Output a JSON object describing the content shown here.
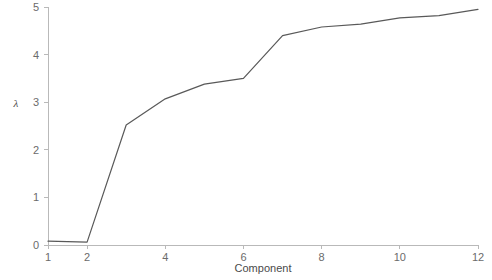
{
  "chart_data": {
    "type": "line",
    "title": "",
    "subtitle": "",
    "xlabel": "Component",
    "ylabel": "λ",
    "x": [
      1,
      2,
      3,
      4,
      5,
      6,
      7,
      8,
      9,
      10,
      11,
      12
    ],
    "values": [
      0.08,
      0.06,
      2.52,
      3.07,
      3.38,
      3.5,
      4.4,
      4.58,
      4.64,
      4.77,
      4.82,
      4.95
    ],
    "series": [
      {
        "name": "eigenvalue",
        "values": [
          0.08,
          0.06,
          2.52,
          3.07,
          3.38,
          3.5,
          4.4,
          4.58,
          4.64,
          4.77,
          4.82,
          4.95
        ]
      }
    ],
    "xlim": [
      1,
      12
    ],
    "ylim": [
      0,
      5
    ],
    "xticks": [
      1,
      2,
      4,
      6,
      8,
      10,
      12
    ],
    "xtick_labels": [
      "1",
      "2",
      "4",
      "6",
      "8",
      "10",
      "12"
    ],
    "yticks": [
      0,
      1,
      2,
      3,
      4,
      5
    ],
    "ytick_labels": [
      "0",
      "1",
      "2",
      "3",
      "4",
      "5"
    ],
    "grid": false,
    "legend": false,
    "legend_position": "none",
    "line_color": "#595959",
    "axis_color": "#b9b9b9",
    "tick_label_color": "#6b6b6b",
    "background": "#ffffff",
    "annotations": []
  }
}
